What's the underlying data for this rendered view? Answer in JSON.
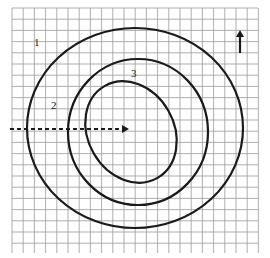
{
  "diagram": {
    "type": "contour-map-on-grid",
    "grid": {
      "x0": 12,
      "y0": 8,
      "x1": 258,
      "y1": 253,
      "cell": 11.2,
      "line_color": "#9a9a9a"
    },
    "stroke_color": "#1a1a1a",
    "contours": [
      {
        "id": "outer",
        "cx": 135,
        "cy": 128,
        "rx": 108,
        "ry": 100,
        "rotate": 0
      },
      {
        "id": "middle",
        "cx": 138,
        "cy": 132,
        "rx": 70,
        "ry": 73,
        "rotate": 0
      },
      {
        "id": "inner",
        "cx": 131,
        "cy": 132,
        "rx": 43,
        "ry": 53,
        "rotate": -30
      }
    ],
    "labels": [
      {
        "text": "1",
        "x": 34,
        "y": 46
      },
      {
        "text": "2",
        "x": 51,
        "y": 109
      },
      {
        "text": "3",
        "x": 131,
        "y": 77
      }
    ],
    "dashed_arrow": {
      "x1": 10,
      "y1": 129,
      "x2": 124,
      "y2": 129
    },
    "north_arrow": {
      "x": 240,
      "y1": 53,
      "y2": 30,
      "label": "north-arrow"
    }
  }
}
